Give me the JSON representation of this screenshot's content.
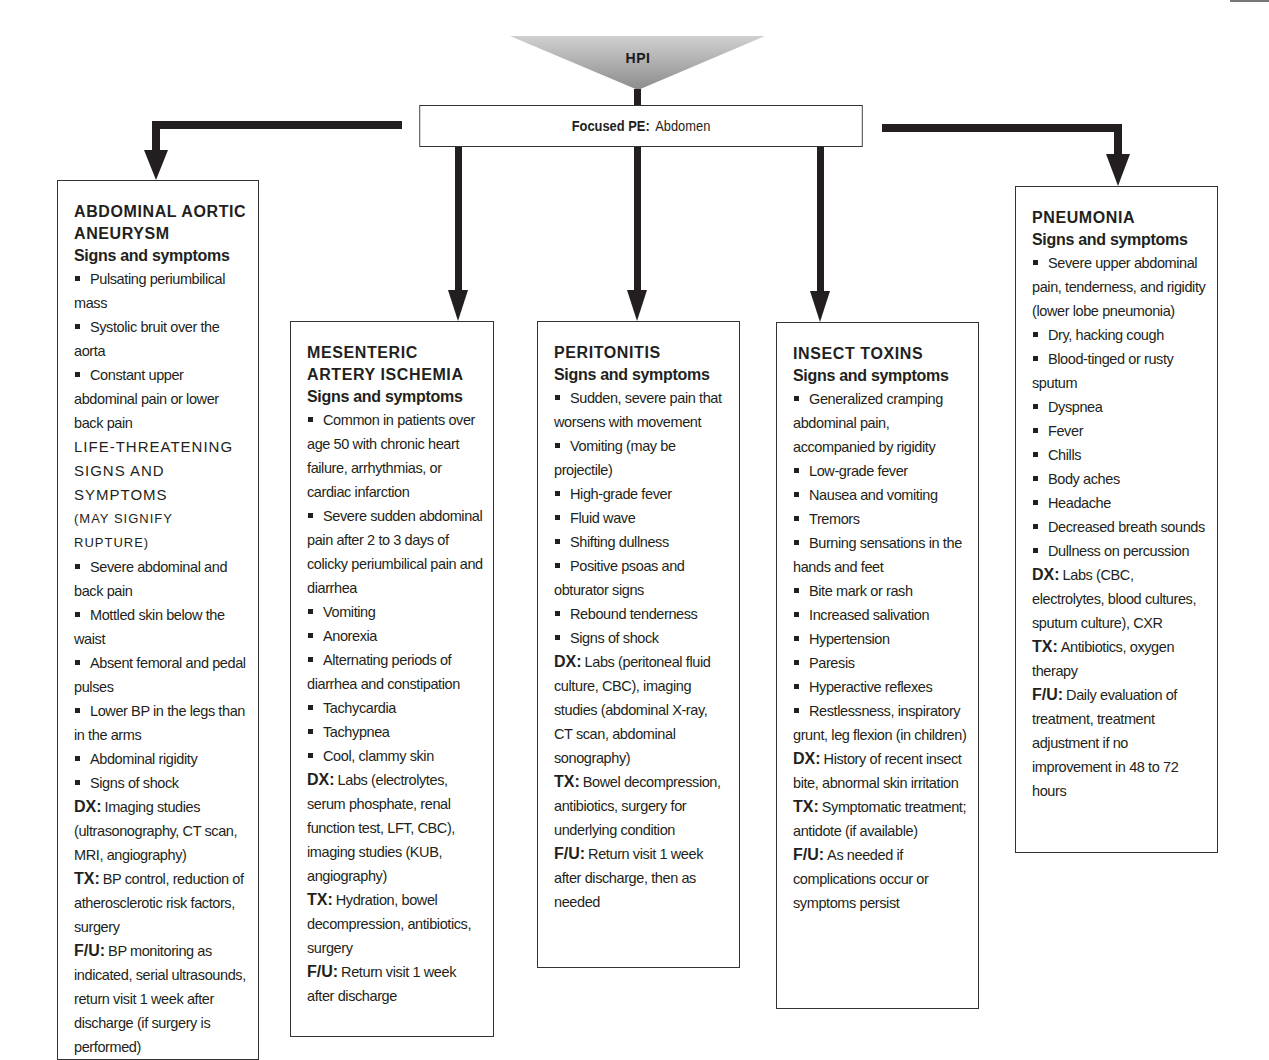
{
  "header": {
    "hpi_label": "HPI",
    "focused_pe_label": "Focused PE:",
    "focused_pe_value": "Abdomen"
  },
  "colors": {
    "line": "#231f20",
    "box_border": "#333333",
    "triangle_top": "#c8c8c8",
    "triangle_bottom": "#8a8a8a"
  },
  "conditions": [
    {
      "title_lines": [
        "ABDOMINAL AORTIC",
        "ANEURYSM"
      ],
      "subtitle": "Signs and symptoms",
      "signs": [
        "Pulsating periumbilical mass",
        "Systolic bruit over the aorta",
        "Constant upper abdominal pain or lower back pain"
      ],
      "life_threatening_heading": [
        "LIFE-THREATENING",
        "SIGNS AND SYMPTOMS"
      ],
      "life_threatening_note": "(MAY SIGNIFY RUPTURE)",
      "life_threatening_signs": [
        "Severe abdominal and back pain",
        "Mottled skin below the waist",
        "Absent femoral and pedal pulses",
        "Lower BP in the legs than in the arms",
        "Abdominal rigidity",
        "Signs of shock"
      ],
      "dx_label": "DX:",
      "dx": "Imaging studies (ultrasonography, CT scan, MRI, angiography)",
      "tx_label": "TX:",
      "tx": "BP control, reduction of atherosclerotic risk factors, surgery",
      "fu_label": "F/U:",
      "fu": "BP monitoring as indicated, serial ultrasounds, return visit 1 week after discharge (if surgery is performed)"
    },
    {
      "title_lines": [
        "MESENTERIC",
        "ARTERY ISCHEMIA"
      ],
      "subtitle": "Signs and symptoms",
      "signs": [
        "Common in patients over age 50 with chronic heart failure, arrhythmias, or cardiac infarction",
        "Severe sudden abdominal pain after 2 to 3 days of colicky periumbilical pain and diarrhea",
        "Vomiting",
        "Anorexia",
        "Alternating periods of diarrhea and constipation",
        "Tachycardia",
        "Tachypnea",
        "Cool, clammy skin"
      ],
      "dx_label": "DX:",
      "dx": "Labs (electrolytes, serum phosphate, renal function test, LFT, CBC), imaging studies (KUB, angiography)",
      "tx_label": "TX:",
      "tx": "Hydration, bowel decompression, antibiotics, surgery",
      "fu_label": "F/U:",
      "fu": "Return visit 1 week after discharge"
    },
    {
      "title_lines": [
        "PERITONITIS"
      ],
      "subtitle": "Signs and symptoms",
      "signs": [
        "Sudden, severe pain that worsens with movement",
        "Vomiting (may be projectile)",
        "High-grade fever",
        "Fluid wave",
        "Shifting dullness",
        "Positive psoas and obturator signs",
        "Rebound tenderness",
        "Signs of shock"
      ],
      "dx_label": "DX:",
      "dx": "Labs (peritoneal fluid culture, CBC), imaging studies (abdominal X-ray, CT scan, abdominal sonography)",
      "tx_label": "TX:",
      "tx": "Bowel decompression, antibiotics, surgery for underlying condition",
      "fu_label": "F/U:",
      "fu": "Return visit 1 week after discharge, then as needed"
    },
    {
      "title_lines": [
        "INSECT TOXINS"
      ],
      "subtitle": "Signs and symptoms",
      "signs": [
        "Generalized cramping abdominal pain, accompanied by rigidity",
        "Low-grade fever",
        "Nausea and vomiting",
        "Tremors",
        "Burning sensations in the hands and feet",
        "Bite mark or rash",
        "Increased salivation",
        "Hypertension",
        "Paresis",
        "Hyperactive reflexes",
        "Restlessness, inspiratory grunt, leg flexion (in children)"
      ],
      "dx_label": "DX:",
      "dx": "History of recent insect bite, abnormal skin irritation",
      "tx_label": "TX:",
      "tx": "Symptomatic treatment; antidote (if available)",
      "fu_label": "F/U:",
      "fu": "As needed if complications occur or symptoms persist"
    },
    {
      "title_lines": [
        "PNEUMONIA"
      ],
      "subtitle": "Signs and symptoms",
      "signs": [
        "Severe upper abdominal pain, tenderness, and rigidity (lower lobe pneumonia)",
        "Dry, hacking cough",
        "Blood-tinged or rusty sputum",
        "Dyspnea",
        "Fever",
        "Chills",
        "Body aches",
        "Headache",
        "Decreased breath sounds",
        "Dullness on percussion"
      ],
      "dx_label": "DX:",
      "dx": "Labs (CBC, electrolytes, blood cultures, sputum culture), CXR",
      "tx_label": "TX:",
      "tx": "Antibiotics, oxygen therapy",
      "fu_label": "F/U:",
      "fu": "Daily evaluation of treatment, treatment adjustment if no improvement in 48 to 72 hours"
    }
  ]
}
